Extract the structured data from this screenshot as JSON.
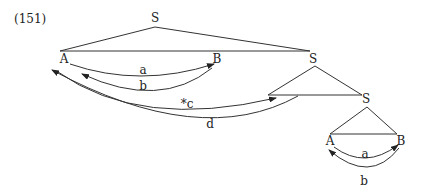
{
  "example_number": "(151)",
  "nodes": {
    "S_root": "S",
    "A_top": "A",
    "B_top": "B",
    "S_mid": "S",
    "S_low": "S",
    "A_low": "A",
    "B_low": "B"
  },
  "arcs": {
    "a_top": "a",
    "b_top": "b",
    "c": "*c",
    "d": "d",
    "a_low": "a",
    "b_low": "b"
  },
  "colors": {
    "ink": "#222222",
    "background": "#ffffff"
  }
}
